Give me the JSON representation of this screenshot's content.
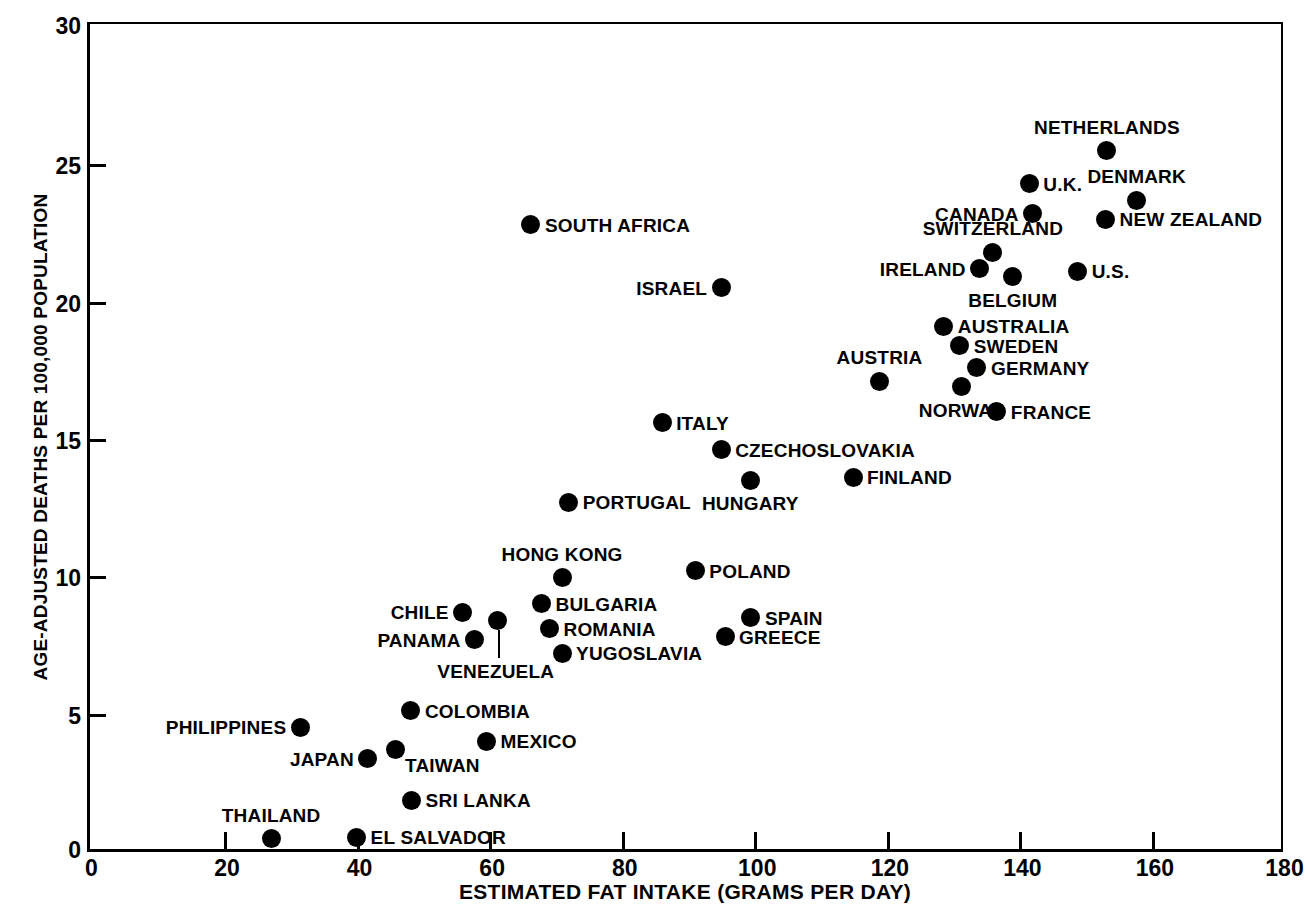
{
  "chart_data": {
    "type": "scatter",
    "title": "",
    "xlabel": "ESTIMATED FAT INTAKE (GRAMS PER DAY)",
    "ylabel": "AGE-ADJUSTED DEATHS PER 100,000 POPULATION",
    "xlim": [
      0,
      180
    ],
    "ylim": [
      0,
      30
    ],
    "xticks": [
      0,
      20,
      40,
      60,
      80,
      100,
      120,
      140,
      160,
      180
    ],
    "yticks": [
      0,
      5,
      10,
      15,
      20,
      25,
      30
    ],
    "xtick_labels": [
      "0",
      "20",
      "40",
      "60",
      "80",
      "100",
      "120",
      "140",
      "160",
      "180"
    ],
    "ytick_labels": [
      "0",
      "5",
      "10",
      "15",
      "20",
      "25",
      "30"
    ],
    "grid": false,
    "legend": "none",
    "marker_color": "#000000",
    "background_color": "#ffffff",
    "points": [
      {
        "label": "NETHERLANDS",
        "x": 153.2,
        "y": 25.5,
        "pos": "above"
      },
      {
        "label": "U.K.",
        "x": 141.5,
        "y": 24.3,
        "pos": "right"
      },
      {
        "label": "DENMARK",
        "x": 157.7,
        "y": 23.7,
        "pos": "above"
      },
      {
        "label": "CANADA",
        "x": 142.0,
        "y": 23.2,
        "pos": "left"
      },
      {
        "label": "NEW ZEALAND",
        "x": 153.0,
        "y": 23.0,
        "pos": "right"
      },
      {
        "label": "SOUTH AFRICA",
        "x": 66.3,
        "y": 22.8,
        "pos": "right"
      },
      {
        "label": "SWITZERLAND",
        "x": 136.0,
        "y": 21.8,
        "pos": "above"
      },
      {
        "label": "IRELAND",
        "x": 134.0,
        "y": 21.2,
        "pos": "left"
      },
      {
        "label": "U.S.",
        "x": 148.8,
        "y": 21.1,
        "pos": "right"
      },
      {
        "label": "BELGIUM",
        "x": 139.0,
        "y": 20.9,
        "pos": "below"
      },
      {
        "label": "ISRAEL",
        "x": 95.0,
        "y": 20.5,
        "pos": "left"
      },
      {
        "label": "AUSTRALIA",
        "x": 128.6,
        "y": 19.1,
        "pos": "right"
      },
      {
        "label": "SWEDEN",
        "x": 131.0,
        "y": 18.4,
        "pos": "right"
      },
      {
        "label": "GERMANY",
        "x": 133.6,
        "y": 17.6,
        "pos": "right"
      },
      {
        "label": "AUSTRIA",
        "x": 118.9,
        "y": 17.1,
        "pos": "above"
      },
      {
        "label": "NORWAY",
        "x": 131.2,
        "y": 16.9,
        "pos": "below"
      },
      {
        "label": "FRANCE",
        "x": 136.6,
        "y": 16.0,
        "pos": "right"
      },
      {
        "label": "ITALY",
        "x": 86.1,
        "y": 15.6,
        "pos": "right"
      },
      {
        "label": "CZECHOSLOVAKIA",
        "x": 95.0,
        "y": 14.6,
        "pos": "right"
      },
      {
        "label": "FINLAND",
        "x": 114.9,
        "y": 13.6,
        "pos": "right"
      },
      {
        "label": "HUNGARY",
        "x": 99.4,
        "y": 13.5,
        "pos": "below"
      },
      {
        "label": "PORTUGAL",
        "x": 72.0,
        "y": 12.7,
        "pos": "right"
      },
      {
        "label": "POLAND",
        "x": 91.1,
        "y": 10.2,
        "pos": "right"
      },
      {
        "label": "HONG KONG",
        "x": 71.0,
        "y": 9.95,
        "pos": "above"
      },
      {
        "label": "BULGARIA",
        "x": 67.9,
        "y": 9.0,
        "pos": "right"
      },
      {
        "label": "CHILE",
        "x": 56.0,
        "y": 8.7,
        "pos": "left"
      },
      {
        "label": "SPAIN",
        "x": 99.5,
        "y": 8.5,
        "pos": "right"
      },
      {
        "label": "VENEZUELA",
        "x": 61.3,
        "y": 8.4,
        "pos": "leader"
      },
      {
        "label": "ROMANIA",
        "x": 69.1,
        "y": 8.1,
        "pos": "right"
      },
      {
        "label": "PANAMA",
        "x": 57.8,
        "y": 7.7,
        "pos": "left"
      },
      {
        "label": "GREECE",
        "x": 95.6,
        "y": 7.8,
        "pos": "right"
      },
      {
        "label": "YUGOSLAVIA",
        "x": 71.0,
        "y": 7.2,
        "pos": "right"
      },
      {
        "label": "COLOMBIA",
        "x": 48.2,
        "y": 5.1,
        "pos": "right"
      },
      {
        "label": "PHILIPPINES",
        "x": 31.5,
        "y": 4.5,
        "pos": "left"
      },
      {
        "label": "MEXICO",
        "x": 59.6,
        "y": 4.0,
        "pos": "right"
      },
      {
        "label": "TAIWAN",
        "x": 45.8,
        "y": 3.7,
        "pos": "below-right"
      },
      {
        "label": "JAPAN",
        "x": 41.7,
        "y": 3.35,
        "pos": "left"
      },
      {
        "label": "SRI LANKA",
        "x": 48.3,
        "y": 1.85,
        "pos": "right"
      },
      {
        "label": "THAILAND",
        "x": 27.1,
        "y": 0.45,
        "pos": "above"
      },
      {
        "label": "EL SALVADOR",
        "x": 40.0,
        "y": 0.5,
        "pos": "right"
      }
    ]
  }
}
